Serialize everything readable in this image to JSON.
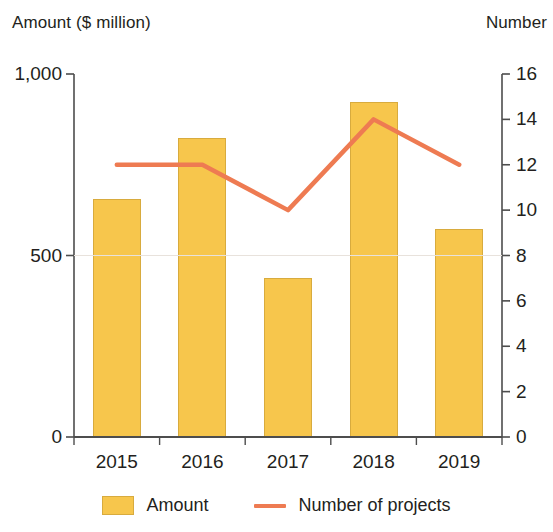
{
  "chart_data": {
    "type": "bar",
    "title": "",
    "categories": [
      "2015",
      "2016",
      "2017",
      "2018",
      "2019"
    ],
    "xlabel": "",
    "grid": false,
    "legend_position": "bottom",
    "axes": {
      "left": {
        "label": "Amount ($ million)",
        "ticks": [
          "1,000",
          "500",
          "0"
        ],
        "tick_values": [
          1000,
          500,
          0
        ],
        "ylim": [
          0,
          1000
        ]
      },
      "right": {
        "label": "Number",
        "ticks": [
          "16",
          "14",
          "12",
          "10",
          "8",
          "6",
          "4",
          "2",
          "0"
        ],
        "tick_values": [
          16,
          14,
          12,
          10,
          8,
          6,
          4,
          2,
          0
        ],
        "ylim": [
          0,
          16
        ]
      }
    },
    "series": [
      {
        "name": "Amount",
        "type": "bar",
        "axis": "left",
        "color": "#f7c64c",
        "values": [
          657,
          823,
          439,
          922,
          574
        ]
      },
      {
        "name": "Number of projects",
        "type": "line",
        "axis": "right",
        "color": "#ee7b52",
        "values": [
          12,
          12,
          10,
          14,
          12
        ]
      }
    ]
  },
  "legend": {
    "items": [
      {
        "label": "Amount",
        "marker": "bar-swatch"
      },
      {
        "label": "Number of projects",
        "marker": "line-swatch"
      }
    ]
  }
}
